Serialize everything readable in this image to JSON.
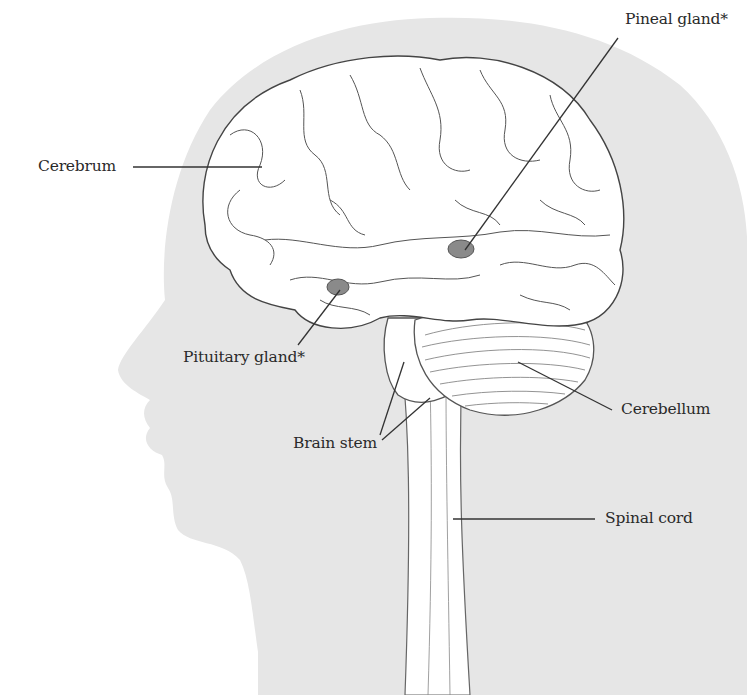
{
  "diagram": {
    "title": "",
    "colors": {
      "silhouette": "#e6e6e6",
      "brain_fill": "#ffffff",
      "outline": "#555555",
      "gland_fill": "#8a8a8a",
      "leader_line": "#333333",
      "label_text": "#2a2a2a"
    },
    "labels": [
      {
        "id": "cerebrum",
        "text": "Cerebrum"
      },
      {
        "id": "pineal",
        "text": "Pineal gland*"
      },
      {
        "id": "pituitary",
        "text": "Pituitary gland*"
      },
      {
        "id": "cerebellum",
        "text": "Cerebellum"
      },
      {
        "id": "brainstem",
        "text": "Brain stem"
      },
      {
        "id": "spinalcord",
        "text": "Spinal cord"
      }
    ]
  }
}
